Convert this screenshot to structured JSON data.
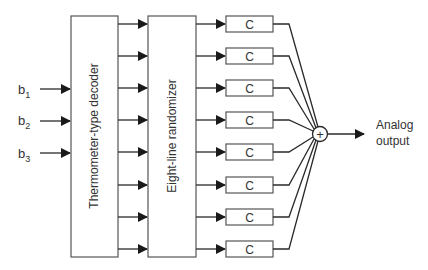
{
  "diagram": {
    "inputs": [
      {
        "base": "b",
        "sub": "1"
      },
      {
        "base": "b",
        "sub": "2"
      },
      {
        "base": "b",
        "sub": "3"
      }
    ],
    "decoder_label": "Thermometer-type decoder",
    "randomizer_label": "Eight-line randomizer",
    "element_labels": [
      "C",
      "C",
      "C",
      "C",
      "C",
      "C",
      "C",
      "C"
    ],
    "sum_symbol": "+",
    "output_label_line1": "Analog",
    "output_label_line2": "output",
    "line_count": 8
  }
}
